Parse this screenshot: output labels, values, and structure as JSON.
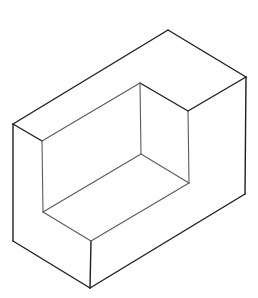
{
  "figure": {
    "type": "isometric-line-drawing",
    "colors": {
      "background": "#ffffff",
      "outer_edges": "#1e1e1e",
      "inner_edges": "#5a5a5a"
    },
    "vertices": {
      "top_back": [
        168,
        30
      ],
      "right_top": [
        246,
        77
      ],
      "right_bottom": [
        245,
        194
      ],
      "bottom_front": [
        90,
        288
      ],
      "left_bottom": [
        13,
        241
      ],
      "left_top": [
        13,
        124
      ],
      "lip_front_top": [
        42,
        141
      ],
      "pocket_back_top": [
        140,
        83
      ],
      "step_right_top": [
        188,
        111
      ],
      "pocket_back_floor": [
        141,
        154
      ],
      "step_right_floor": [
        189,
        183
      ],
      "pocket_left_floor": [
        43,
        212
      ],
      "step_front_floor": [
        91,
        241
      ]
    },
    "edges": {
      "outer": [
        [
          "left_top",
          "top_back"
        ],
        [
          "top_back",
          "right_top"
        ],
        [
          "right_top",
          "right_bottom"
        ],
        [
          "right_bottom",
          "bottom_front"
        ],
        [
          "bottom_front",
          "left_bottom"
        ],
        [
          "left_bottom",
          "left_top"
        ],
        [
          "left_top",
          "lip_front_top"
        ],
        [
          "right_top",
          "step_right_top"
        ],
        [
          "step_right_top",
          "pocket_back_top"
        ],
        [
          "step_front_floor",
          "bottom_front"
        ]
      ],
      "inner": [
        [
          "lip_front_top",
          "pocket_back_top"
        ],
        [
          "pocket_back_top",
          "pocket_back_floor"
        ],
        [
          "step_right_top",
          "step_right_floor"
        ],
        [
          "lip_front_top",
          "pocket_left_floor"
        ],
        [
          "pocket_left_floor",
          "pocket_back_floor"
        ],
        [
          "pocket_back_floor",
          "step_right_floor"
        ],
        [
          "pocket_left_floor",
          "step_front_floor"
        ],
        [
          "step_front_floor",
          "step_right_floor"
        ]
      ]
    }
  }
}
